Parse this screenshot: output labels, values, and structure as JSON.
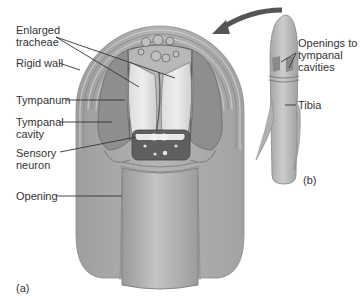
{
  "figure": {
    "panel_a": {
      "tag": "(a)",
      "labels": {
        "enlarged_tracheae": "Enlarged\ntracheae",
        "rigid_wall": "Rigid wall",
        "tympanum": "Tympanum",
        "tympanal_cavity": "Tympanal\ncavity",
        "sensory_neuron": "Sensory\nneuron",
        "opening": "Opening"
      }
    },
    "panel_b": {
      "tag": "(b)",
      "labels": {
        "openings": "Openings to\ntympanal\ncavities",
        "tibia": "Tibia"
      }
    },
    "colors": {
      "body": "#a8a8a8",
      "light": "#cfcfcf",
      "dark": "#5f5f5f",
      "line": "#333333"
    }
  }
}
